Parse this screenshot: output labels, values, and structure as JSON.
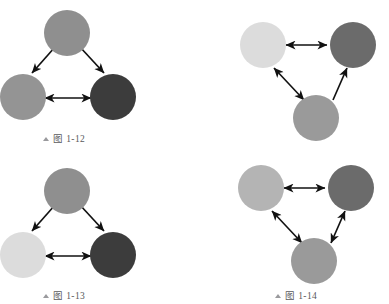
{
  "page": {
    "background": "#ffffff",
    "width": 389,
    "height": 304
  },
  "style": {
    "arrow_color": "#111111",
    "caption_color": "#59595c",
    "marker_color": "#9a9a9d",
    "node_colors": {
      "light": "#dcdcdc",
      "medium_light": "#b4b4b4",
      "medium": "#8f8f8f",
      "dark": "#6b6b6b",
      "very_dark": "#3c3c3c"
    }
  },
  "figures": [
    {
      "id": "fig-1-12",
      "caption": {
        "marker": "triangle-up-icon",
        "text": "图 1-12"
      },
      "nodes": [
        {
          "id": "top",
          "label": "node-top",
          "color": "#8f8f8f"
        },
        {
          "id": "left",
          "label": "node-left",
          "color": "#949494"
        },
        {
          "id": "right",
          "label": "node-right",
          "color": "#3c3c3c"
        }
      ],
      "edges": [
        {
          "from": "top",
          "to": "left",
          "direction": "single"
        },
        {
          "from": "top",
          "to": "right",
          "direction": "single"
        },
        {
          "from": "left",
          "to": "right",
          "direction": "double"
        }
      ]
    },
    {
      "id": "fig-top-right",
      "caption": {
        "marker": "",
        "text": ""
      },
      "nodes": [
        {
          "id": "left",
          "label": "node-left",
          "color": "#dcdcdc"
        },
        {
          "id": "right",
          "label": "node-right",
          "color": "#6b6b6b"
        },
        {
          "id": "bottom",
          "label": "node-bottom",
          "color": "#9a9a9a"
        }
      ],
      "edges": [
        {
          "from": "left",
          "to": "right",
          "direction": "double"
        },
        {
          "from": "left",
          "to": "bottom",
          "direction": "double"
        },
        {
          "from": "bottom",
          "to": "right",
          "direction": "single"
        }
      ]
    },
    {
      "id": "fig-1-13",
      "caption": {
        "marker": "triangle-up-icon",
        "text": "图 1-13"
      },
      "nodes": [
        {
          "id": "top",
          "label": "node-top",
          "color": "#8f8f8f"
        },
        {
          "id": "left",
          "label": "node-left",
          "color": "#dcdcdc"
        },
        {
          "id": "right",
          "label": "node-right",
          "color": "#3c3c3c"
        }
      ],
      "edges": [
        {
          "from": "top",
          "to": "left",
          "direction": "single"
        },
        {
          "from": "top",
          "to": "right",
          "direction": "single"
        },
        {
          "from": "left",
          "to": "right",
          "direction": "double"
        }
      ]
    },
    {
      "id": "fig-1-14",
      "caption": {
        "marker": "triangle-up-icon",
        "text": "图 1-14"
      },
      "nodes": [
        {
          "id": "left",
          "label": "node-left",
          "color": "#b4b4b4"
        },
        {
          "id": "right",
          "label": "node-right",
          "color": "#6b6b6b"
        },
        {
          "id": "bottom",
          "label": "node-bottom",
          "color": "#9a9a9a"
        }
      ],
      "edges": [
        {
          "from": "left",
          "to": "right",
          "direction": "double"
        },
        {
          "from": "left",
          "to": "bottom",
          "direction": "double"
        },
        {
          "from": "bottom",
          "to": "right",
          "direction": "double"
        }
      ]
    }
  ]
}
